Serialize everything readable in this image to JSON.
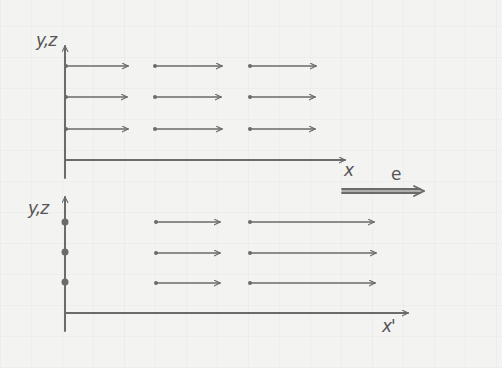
{
  "diagram": {
    "stroke_color": "#6b6b6b",
    "background_color": "#f3f3f1",
    "top_panel": {
      "vertical_axis_label": "y,z",
      "horizontal_axis_label": "x",
      "axis_origin": [
        65,
        160
      ],
      "vertical_axis_top": 46,
      "horizontal_axis_end": 345,
      "rows_y": [
        66,
        97,
        129
      ],
      "arrows": [
        {
          "x1": 66,
          "x2": 128,
          "y": 66
        },
        {
          "x1": 155,
          "x2": 222,
          "y": 66
        },
        {
          "x1": 250,
          "x2": 316,
          "y": 66
        },
        {
          "x1": 66,
          "x2": 127,
          "y": 97
        },
        {
          "x1": 155,
          "x2": 221,
          "y": 97
        },
        {
          "x1": 250,
          "x2": 315,
          "y": 97
        },
        {
          "x1": 66,
          "x2": 128,
          "y": 129
        },
        {
          "x1": 155,
          "x2": 222,
          "y": 129
        },
        {
          "x1": 250,
          "x2": 315,
          "y": 129
        }
      ]
    },
    "field_vector": {
      "label": "e",
      "x1": 342,
      "x2": 424,
      "y": 191
    },
    "bottom_panel": {
      "vertical_axis_label": "y,z",
      "horizontal_axis_label": "x'",
      "axis_origin": [
        65,
        313
      ],
      "vertical_axis_top": 197,
      "horizontal_axis_end": 408,
      "axis_dots_y": [
        222,
        252,
        282
      ],
      "arrows": [
        {
          "x1": 156,
          "x2": 220,
          "y": 222
        },
        {
          "x1": 250,
          "x2": 374,
          "y": 222
        },
        {
          "x1": 156,
          "x2": 220,
          "y": 253
        },
        {
          "x1": 250,
          "x2": 376,
          "y": 253
        },
        {
          "x1": 156,
          "x2": 220,
          "y": 283
        },
        {
          "x1": 250,
          "x2": 375,
          "y": 283
        }
      ]
    }
  }
}
